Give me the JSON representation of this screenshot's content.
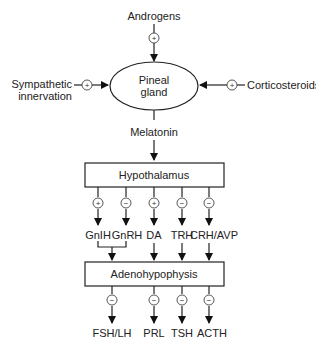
{
  "diagram": {
    "inputs": {
      "top": "Androgens",
      "left_line1": "Sympathetic",
      "left_line2": "innervation",
      "right": "Corticosteroids"
    },
    "center": {
      "line1": "Pineal",
      "line2": "gland"
    },
    "output": "Melatonin",
    "hypothalamus": "Hypothalamus",
    "hypothalamic_factors": [
      {
        "label": "GnIH",
        "sign": "+"
      },
      {
        "label": "GnRH",
        "sign": "−"
      },
      {
        "label": "DA",
        "sign": "+"
      },
      {
        "label": "TRH",
        "sign": "−"
      },
      {
        "label": "CRH/AVP",
        "sign": "−"
      }
    ],
    "adenohypophysis": "Adenohypophysis",
    "pituitary_hormones": [
      {
        "label": "FSH/LH",
        "sign": "−"
      },
      {
        "label": "PRL",
        "sign": "−"
      },
      {
        "label": "TSH",
        "sign": "−"
      },
      {
        "label": "ACTH",
        "sign": "−"
      }
    ],
    "signs": {
      "top": "+",
      "left": "+",
      "right": "+"
    }
  }
}
